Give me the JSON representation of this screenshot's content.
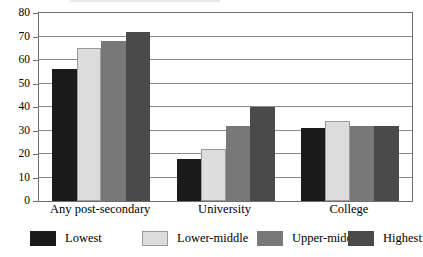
{
  "chart_data": {
    "type": "bar",
    "title": "",
    "subtitle": "",
    "xlabel": "",
    "ylabel": "",
    "categories": [
      "Any post-secondary",
      "University",
      "College"
    ],
    "series": [
      {
        "name": "Lowest",
        "color": "#1a1a1a",
        "values": [
          56,
          18,
          31
        ]
      },
      {
        "name": "Lower-middle",
        "color": "#dcdcdc",
        "values": [
          65,
          22,
          34
        ]
      },
      {
        "name": "Upper-middle",
        "color": "#787878",
        "values": [
          68,
          32,
          32
        ]
      },
      {
        "name": "Highest",
        "color": "#4a4a4a",
        "values": [
          72,
          40,
          32
        ]
      }
    ],
    "ylim": [
      0,
      80
    ],
    "ytick_step": 10,
    "yticks": [
      0,
      10,
      20,
      30,
      40,
      50,
      60,
      70,
      80
    ],
    "ytick_labels": [
      "0",
      "10",
      "20",
      "30",
      "40",
      "50",
      "60",
      "70",
      "80"
    ],
    "grid": true,
    "grid_axis": "y",
    "legend_position": "bottom",
    "frame": true
  },
  "legend": {
    "items": [
      {
        "label": "Lowest",
        "color": "#1a1a1a"
      },
      {
        "label": "Lower-middle",
        "color": "#dcdcdc"
      },
      {
        "label": "Upper-middle",
        "color": "#787878"
      },
      {
        "label": "Highest",
        "color": "#4a4a4a"
      }
    ]
  }
}
